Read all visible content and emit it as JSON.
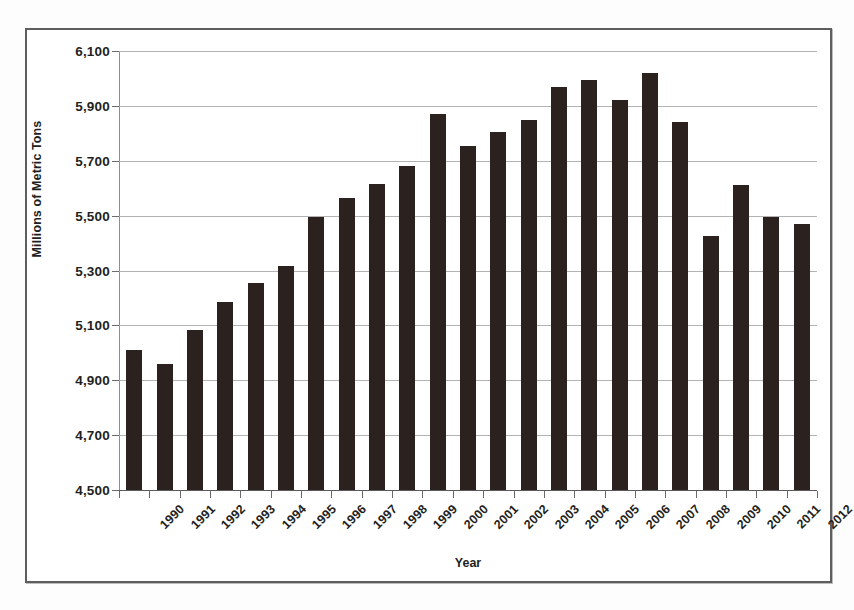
{
  "chart_data": {
    "type": "bar",
    "title": "",
    "xlabel": "Year",
    "ylabel": "Millions of Metric Tons",
    "categories": [
      "1990",
      "1991",
      "1992",
      "1993",
      "1994",
      "1995",
      "1996",
      "1997",
      "1998",
      "1999",
      "2000",
      "2001",
      "2002",
      "2003",
      "2004",
      "2005",
      "2006",
      "2007",
      "2008",
      "2009",
      "2010",
      "2011",
      "2012"
    ],
    "values": [
      5010,
      4960,
      5085,
      5185,
      5255,
      5315,
      5495,
      5565,
      5615,
      5680,
      5870,
      5755,
      5805,
      5850,
      5970,
      5995,
      5920,
      6020,
      5840,
      5425,
      5610,
      5495,
      5470
    ],
    "ylim": [
      4500,
      6100
    ],
    "ytick_step": 200,
    "ytick_labels": [
      "6,100",
      "5,900",
      "5,700",
      "5,500",
      "5,300",
      "5,100",
      "4,900",
      "4,700",
      "4,500"
    ],
    "ytick_values": [
      6100,
      5900,
      5700,
      5500,
      5300,
      5100,
      4900,
      4700,
      4500
    ],
    "grid": true,
    "legend": false,
    "legend_position": "none",
    "bar_color": "#2b2220",
    "grid_color": "#b2b2b2",
    "axis_color": "#5b5b5b",
    "text_color": "#231f20"
  }
}
